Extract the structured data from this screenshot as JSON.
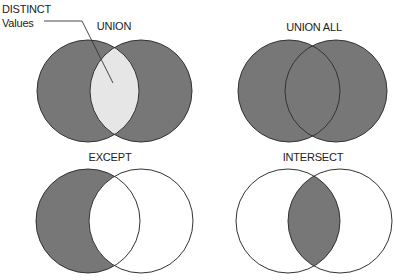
{
  "callout": {
    "line1": "DISTINCT",
    "line2": "Values"
  },
  "diagrams": [
    {
      "title": "UNION",
      "fill_left": "#777777",
      "fill_right": "#777777",
      "fill_overlap": "#e6e6e6"
    },
    {
      "title": "UNION ALL",
      "fill_left": "#777777",
      "fill_right": "#777777",
      "fill_overlap": "#777777"
    },
    {
      "title": "EXCEPT",
      "fill_left": "#777777",
      "fill_right": "#ffffff",
      "fill_overlap": "#ffffff"
    },
    {
      "title": "INTERSECT",
      "fill_left": "#ffffff",
      "fill_right": "#ffffff",
      "fill_overlap": "#777777"
    }
  ],
  "colors": {
    "stroke": "#333333",
    "shade": "#777777",
    "light": "#e6e6e6",
    "background": "#ffffff"
  }
}
